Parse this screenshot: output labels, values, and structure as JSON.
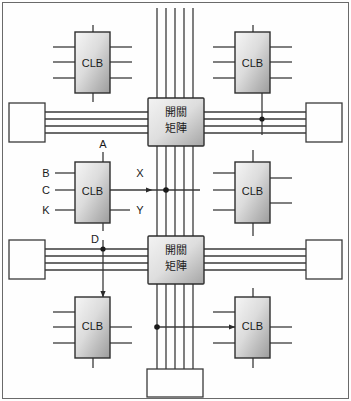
{
  "diagram": {
    "frame": {
      "border_color": "#555555",
      "background": "#fefefe"
    }
  },
  "colors": {
    "line": "#3a3a3a",
    "block_stroke": "#2e2e2e",
    "block_fill_light": "#f2f2f2",
    "block_fill_dark": "#9d9d9d",
    "matrix_fill_light": "#efefef",
    "matrix_fill_dark": "#a8a8a8",
    "text": "#1a1a1a",
    "junction": "#1a1a1a"
  },
  "labels": {
    "clb": "CLB",
    "switch_matrix_line1": "開關",
    "switch_matrix_line2": "矩陣"
  },
  "clb_blocks": [
    {
      "id": "clb-top-left",
      "label": "CLB"
    },
    {
      "id": "clb-top-right",
      "label": "CLB"
    },
    {
      "id": "clb-mid-left",
      "label": "CLB"
    },
    {
      "id": "clb-mid-right",
      "label": "CLB"
    },
    {
      "id": "clb-bottom-left",
      "label": "CLB"
    },
    {
      "id": "clb-bottom-right",
      "label": "CLB"
    }
  ],
  "switch_matrices": [
    {
      "id": "switch-matrix-top",
      "line1": "開關",
      "line2": "矩陣"
    },
    {
      "id": "switch-matrix-bottom",
      "line1": "開關",
      "line2": "矩陣"
    }
  ],
  "pin_labels": {
    "top": "A",
    "left": [
      "B",
      "C",
      "K"
    ],
    "right": [
      "X",
      "Y"
    ],
    "bottom": "D"
  },
  "signals": [
    {
      "name": "A",
      "direction": "input",
      "side": "top"
    },
    {
      "name": "B",
      "direction": "input",
      "side": "left"
    },
    {
      "name": "C",
      "direction": "input",
      "side": "left"
    },
    {
      "name": "K",
      "direction": "input",
      "side": "left"
    },
    {
      "name": "X",
      "direction": "output",
      "side": "right"
    },
    {
      "name": "Y",
      "direction": "output",
      "side": "right"
    },
    {
      "name": "D",
      "direction": "output",
      "side": "bottom"
    }
  ],
  "buses": {
    "vertical_line_count": 5,
    "horizontal_line_count": 4
  },
  "io_pads": [
    {
      "id": "io-pad-left-top"
    },
    {
      "id": "io-pad-right-top"
    },
    {
      "id": "io-pad-left-bottom"
    },
    {
      "id": "io-pad-right-bottom"
    },
    {
      "id": "io-pad-bottom"
    }
  ]
}
